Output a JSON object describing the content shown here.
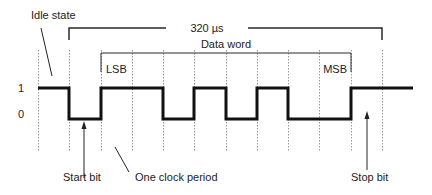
{
  "diagram": {
    "labels": {
      "idle_state": "Idle state",
      "duration": "320 µs",
      "data_word": "Data word",
      "lsb": "LSB",
      "msb": "MSB",
      "level_high": "1",
      "level_low": "0",
      "start_bit": "Start bit",
      "clock_period": "One clock period",
      "stop_bit": "Stop bit"
    },
    "bits": [
      1,
      0,
      1,
      1,
      0,
      1,
      0,
      1,
      0,
      0,
      1,
      1
    ],
    "bit_roles": [
      "idle",
      "start",
      "data",
      "data",
      "data",
      "data",
      "data",
      "data",
      "data",
      "data",
      "stop",
      "idle"
    ],
    "colors": {
      "signal": "#111111",
      "grid": "#9a9a9a",
      "text": "#222222"
    }
  }
}
